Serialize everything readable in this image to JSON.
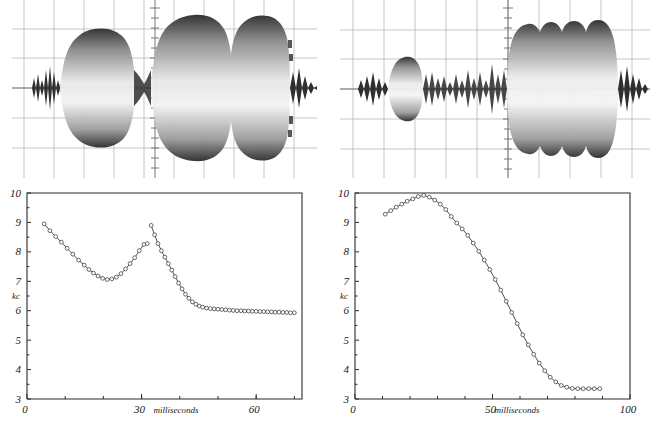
{
  "figure": {
    "title": "",
    "panel_count": 4
  },
  "panels": {
    "scope_left": {
      "name": "oscillogram-left",
      "caption": "",
      "grid": {
        "cols": 10,
        "rows": 8,
        "color": "#b9b9b9"
      },
      "envelope_description": "two-lobe amplitude burst, smaller lobe left, large double-humped lobe right"
    },
    "scope_right": {
      "name": "oscillogram-right",
      "caption": "",
      "grid": {
        "cols": 10,
        "rows": 8,
        "color": "#b9b9b9"
      },
      "envelope_description": "small lobe left, noisy middle, large rippled lobe right"
    }
  },
  "chart_data": [
    {
      "id": "chart-left",
      "type": "line",
      "title": "",
      "xlabel": "milliseconds",
      "ylabel": "kc",
      "xlim": [
        0,
        72
      ],
      "ylim": [
        3,
        10
      ],
      "xticks": [
        0,
        30,
        60
      ],
      "xtick_labels": [
        "0",
        "30",
        "60"
      ],
      "xminor_step": 10,
      "yticks": [
        3,
        4,
        5,
        6,
        7,
        8,
        9,
        10
      ],
      "ytick_labels": [
        "3",
        "4",
        "5",
        "6",
        "7",
        "8",
        "9",
        "10"
      ],
      "grid": false,
      "legend": "none",
      "marker": "open-circle",
      "series": [
        {
          "name": "segment-1",
          "x": [
            4.5,
            6.0,
            7.5,
            9.0,
            10.5,
            12.0,
            13.5,
            15.0,
            16.2,
            17.4,
            18.6,
            19.8,
            21.0,
            22.2,
            23.4,
            24.6,
            25.8,
            27.0,
            28.2,
            29.4,
            30.6,
            31.5
          ],
          "y": [
            8.95,
            8.72,
            8.52,
            8.33,
            8.12,
            7.92,
            7.72,
            7.55,
            7.4,
            7.28,
            7.18,
            7.1,
            7.06,
            7.08,
            7.14,
            7.26,
            7.42,
            7.6,
            7.8,
            8.04,
            8.25,
            8.28
          ]
        },
        {
          "name": "segment-2",
          "x": [
            32.5,
            33.4,
            34.3,
            35.2,
            36.1,
            37.0,
            37.9,
            38.8,
            39.7,
            40.6,
            41.5,
            42.4,
            43.3,
            44.2,
            45.1,
            46.0,
            47.0,
            48.0,
            49.0,
            50.0,
            51.0,
            52.0,
            53.0,
            54.0,
            55.0,
            56.0,
            57.0,
            58.0,
            59.0,
            60.0,
            61.0,
            62.0,
            63.0,
            64.0,
            65.0,
            66.0,
            67.0,
            68.0,
            69.0,
            70.0
          ],
          "y": [
            8.9,
            8.58,
            8.28,
            8.04,
            7.82,
            7.6,
            7.38,
            7.16,
            6.94,
            6.74,
            6.56,
            6.42,
            6.3,
            6.22,
            6.16,
            6.12,
            6.09,
            6.07,
            6.06,
            6.05,
            6.04,
            6.03,
            6.02,
            6.01,
            6.0,
            6.0,
            5.99,
            5.99,
            5.98,
            5.98,
            5.97,
            5.97,
            5.96,
            5.96,
            5.95,
            5.95,
            5.94,
            5.94,
            5.93,
            5.93
          ]
        }
      ]
    },
    {
      "id": "chart-right",
      "type": "line",
      "title": "",
      "xlabel": "milliseconds",
      "ylabel": "kc",
      "xlim": [
        0,
        100
      ],
      "ylim": [
        3,
        10
      ],
      "xticks": [
        0,
        50,
        100
      ],
      "xtick_labels": [
        "0",
        "50",
        "100"
      ],
      "xminor_step": 10,
      "yticks": [
        3,
        4,
        5,
        6,
        7,
        8,
        9,
        10
      ],
      "ytick_labels": [
        "3",
        "4",
        "5",
        "6",
        "7",
        "8",
        "9",
        "10"
      ],
      "grid": false,
      "legend": "none",
      "marker": "open-circle",
      "series": [
        {
          "name": "segment-1",
          "x": [
            11,
            13,
            15,
            17,
            19,
            21,
            23,
            25,
            27,
            29,
            31,
            33,
            35,
            37,
            39,
            41,
            43,
            45,
            47,
            49,
            51,
            53,
            55,
            57,
            59,
            61,
            63,
            65,
            67,
            69,
            71,
            73,
            75,
            77,
            79,
            81,
            83,
            85,
            87,
            89
          ],
          "y": [
            9.28,
            9.4,
            9.52,
            9.62,
            9.72,
            9.8,
            9.88,
            9.92,
            9.86,
            9.76,
            9.62,
            9.44,
            9.2,
            8.98,
            8.78,
            8.56,
            8.3,
            8.02,
            7.72,
            7.4,
            7.06,
            6.7,
            6.32,
            5.94,
            5.56,
            5.18,
            4.84,
            4.52,
            4.22,
            3.96,
            3.74,
            3.58,
            3.46,
            3.4,
            3.36,
            3.35,
            3.35,
            3.35,
            3.35,
            3.35
          ]
        }
      ]
    }
  ]
}
